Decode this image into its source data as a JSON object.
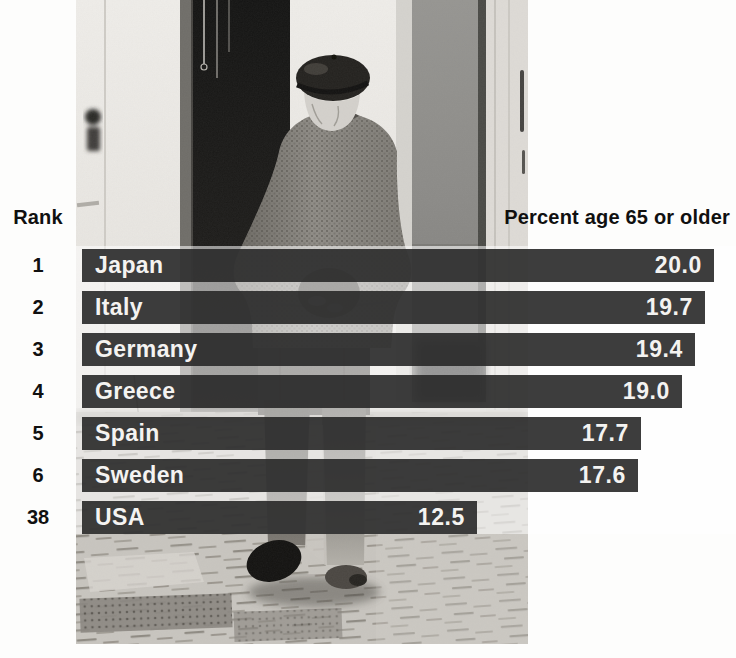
{
  "photo": {
    "alt": "Black-and-white photograph of an elderly man wearing a beret, hands clasped behind his back, walking away down a cobblestone street past a dark doorway"
  },
  "headers": {
    "rank": "Rank",
    "value": "Percent age 65 or older"
  },
  "rows": [
    {
      "rank_label": "1",
      "country": "Japan",
      "value_label": "20.0"
    },
    {
      "rank_label": "2",
      "country": "Italy",
      "value_label": "19.7"
    },
    {
      "rank_label": "3",
      "country": "Germany",
      "value_label": "19.4"
    },
    {
      "rank_label": "4",
      "country": "Greece",
      "value_label": "19.0"
    },
    {
      "rank_label": "5",
      "country": "Spain",
      "value_label": "17.7"
    },
    {
      "rank_label": "6",
      "country": "Sweden",
      "value_label": "17.6"
    },
    {
      "rank_label": "38",
      "country": "USA",
      "value_label": "12.5"
    }
  ],
  "chart_data": {
    "type": "bar",
    "orientation": "horizontal",
    "title": "",
    "rank_header": "Rank",
    "value_header": "Percent age 65 or older",
    "categories": [
      "Japan",
      "Italy",
      "Germany",
      "Greece",
      "Spain",
      "Sweden",
      "USA"
    ],
    "ranks": [
      1,
      2,
      3,
      4,
      5,
      6,
      38
    ],
    "values": [
      20.0,
      19.7,
      19.4,
      19.0,
      17.7,
      17.6,
      12.5
    ],
    "xlim": [
      0,
      20.0
    ],
    "grid": false,
    "legend": "none",
    "bar_color": "#3d3d3d",
    "bar_label_color": "#f4f3f1",
    "text_color": "#101010",
    "background": "#ffffff"
  }
}
